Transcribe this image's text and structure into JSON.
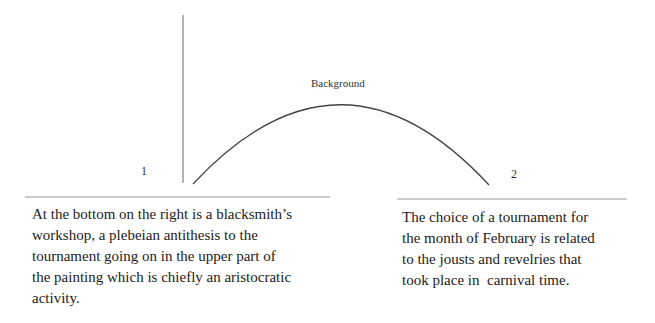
{
  "diagram": {
    "arc_label": "Background",
    "markers": [
      {
        "id": "1",
        "label": "1"
      },
      {
        "id": "2",
        "label": "2"
      }
    ],
    "captions": [
      {
        "marker": "1",
        "lines": [
          "At the bottom on the right is a blacksmith’s",
          "workshop, a plebeian antithesis to the",
          "tournament going on in the upper part of",
          "the painting which is chiefly an aristocratic",
          "activity."
        ]
      },
      {
        "marker": "2",
        "lines": [
          "The choice of a tournament for",
          "the month of February is related",
          "to the jousts and revelries that",
          "took place in  carnival time."
        ]
      }
    ],
    "colors": {
      "line": "#555555",
      "rule": "#999999",
      "text": "#222222"
    }
  }
}
